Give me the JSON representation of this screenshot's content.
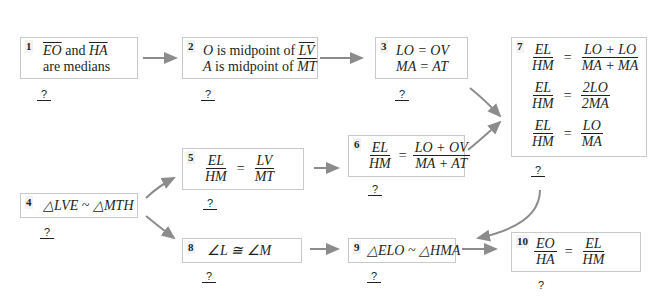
{
  "diagram": {
    "type": "flowchart-proof",
    "reason_placeholder": "?",
    "arrow_color": "#8c8c8c",
    "box_border_color": "#c9c9c9",
    "boxes": [
      {
        "id": 1,
        "number": "1",
        "lines": [
          "EO and HA",
          "are medians"
        ],
        "reason": "?"
      },
      {
        "id": 2,
        "number": "2",
        "lines": [
          "O is midpoint of LV",
          "A is midpoint of MT"
        ],
        "reason": "?"
      },
      {
        "id": 3,
        "number": "3",
        "lines": [
          "LO = OV",
          "MA = AT"
        ],
        "reason": "?"
      },
      {
        "id": 4,
        "number": "4",
        "lines": [
          "△LVE ~ △MTH"
        ],
        "reason": "?"
      },
      {
        "id": 5,
        "number": "5",
        "lines": [
          "EL/HM = LV/MT"
        ],
        "reason": "?"
      },
      {
        "id": 6,
        "number": "6",
        "lines": [
          "EL/HM = (LO + OV)/(MA + AT)"
        ],
        "reason": "?"
      },
      {
        "id": 7,
        "number": "7",
        "lines": [
          "EL/HM = (LO + LO)/(MA + MA)",
          "EL/HM = 2LO/2MA",
          "EL/HM = LO/MA"
        ],
        "reason": "?"
      },
      {
        "id": 8,
        "number": "8",
        "lines": [
          "∠L ≅ ∠M"
        ],
        "reason": "?"
      },
      {
        "id": 9,
        "number": "9",
        "lines": [
          "△ELO ~ △HMA"
        ],
        "reason": "?"
      },
      {
        "id": 10,
        "number": "10",
        "lines": [
          "EO/HA = EL/HM"
        ],
        "reason": "?"
      }
    ],
    "edges": [
      [
        1,
        2
      ],
      [
        2,
        3
      ],
      [
        3,
        7
      ],
      [
        4,
        5
      ],
      [
        4,
        8
      ],
      [
        5,
        6
      ],
      [
        6,
        7
      ],
      [
        7,
        9
      ],
      [
        8,
        9
      ],
      [
        9,
        10
      ]
    ],
    "text": {
      "b1": {
        "seg1": "EO",
        "seg_and": " and ",
        "seg2": "HA",
        "line2": "are medians"
      },
      "b2": {
        "p1": "O",
        "mid1": " is midpoint of ",
        "s1": "LV",
        "p2": "A",
        "mid2": " is midpoint of ",
        "s2": "MT"
      },
      "b3": {
        "l1": "LO = OV",
        "l2": "MA = AT"
      },
      "b4": {
        "l1": "△LVE ~ △MTH"
      },
      "b5": {
        "n1": "EL",
        "d1": "HM",
        "op": "=",
        "n2": "LV",
        "d2": "MT"
      },
      "b6": {
        "n1": "EL",
        "d1": "HM",
        "op": "=",
        "n2": "LO + OV",
        "d2": "MA + AT"
      },
      "b7": {
        "r1": {
          "n1": "EL",
          "d1": "HM",
          "op": "=",
          "n2": "LO + LO",
          "d2": "MA + MA"
        },
        "r2": {
          "n1": "EL",
          "d1": "HM",
          "op": "=",
          "n2": "2LO",
          "d2": "2MA"
        },
        "r3": {
          "n1": "EL",
          "d1": "HM",
          "op": "=",
          "n2": "LO",
          "d2": "MA"
        }
      },
      "b8": {
        "l1": "∠L ≅ ∠M"
      },
      "b9": {
        "l1": "△ELO ~ △HMA"
      },
      "b10": {
        "n1": "EO",
        "d1": "HA",
        "op": "=",
        "n2": "EL",
        "d2": "HM"
      }
    }
  }
}
